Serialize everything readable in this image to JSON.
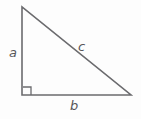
{
  "figure": {
    "name": "right-triangle-diagram",
    "background_color": "#fdfdfd",
    "stroke_color": "#6b6b6e",
    "text_color": "#57575a",
    "stroke_width": 1.6,
    "geometry": {
      "apex": {
        "x": 22,
        "y": 7
      },
      "right_angle_vertex": {
        "x": 22,
        "y": 95
      },
      "base_right_vertex": {
        "x": 131,
        "y": 95
      },
      "right_angle_marker": {
        "x": 23,
        "y": 87,
        "size": 8
      }
    },
    "labels": {
      "vertical_leg": "a",
      "hypotenuse": "c",
      "horizontal_leg": "b"
    }
  }
}
